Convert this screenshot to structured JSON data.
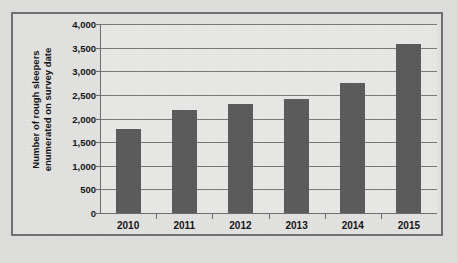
{
  "chart_data": {
    "type": "bar",
    "title": "",
    "xlabel": "",
    "ylabel": "Number of rough sleepers enumerated on survey date",
    "ylabel_line1": "Number of rough sleepers",
    "ylabel_line2": "enumerated on survey date",
    "categories": [
      "2010",
      "2011",
      "2012",
      "2013",
      "2014",
      "2015"
    ],
    "values": [
      1768,
      2181,
      2309,
      2414,
      2744,
      3569
    ],
    "ylim": [
      0,
      4000
    ],
    "ytick_labels": [
      "4,000",
      "3,500",
      "3,000",
      "2,500",
      "2,000",
      "1,500",
      "1,000",
      "500",
      "0"
    ],
    "ytick_values": [
      4000,
      3500,
      3000,
      2500,
      2000,
      1500,
      1000,
      500,
      0
    ],
    "grid": true,
    "legend": false,
    "series_color": "#595959",
    "plot_background": "#e8e8e6",
    "gridline_color": "#777777",
    "axis_color": "#6b6b6b",
    "frame_color": "#6e6e6e",
    "page_background": "#dededc"
  }
}
